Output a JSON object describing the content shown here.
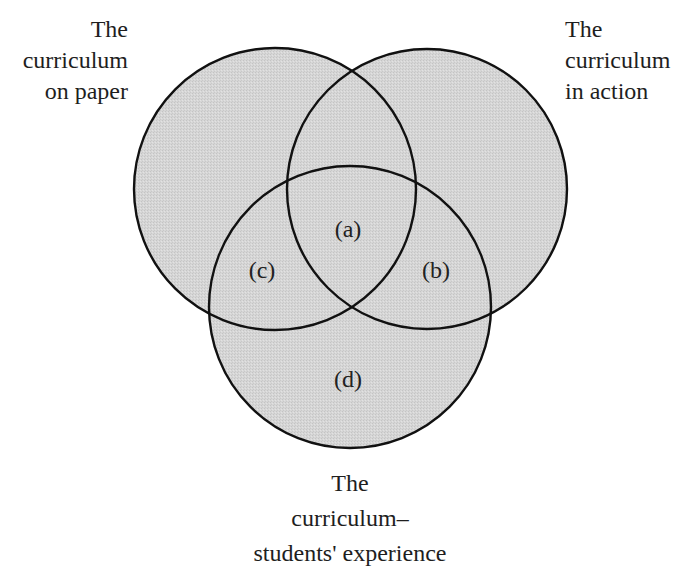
{
  "diagram": {
    "type": "venn",
    "fill_color": "#d4d4d4",
    "stroke_color": "#111111",
    "circles": [
      {
        "id": "paper",
        "cx": 275,
        "cy": 189,
        "r": 141,
        "caption": [
          "The",
          "curriculum",
          "on paper"
        ]
      },
      {
        "id": "action",
        "cx": 427,
        "cy": 189,
        "r": 140,
        "caption": [
          "The",
          "curriculum",
          "in action"
        ]
      },
      {
        "id": "experience",
        "cx": 350,
        "cy": 307,
        "r": 141,
        "caption": [
          "The",
          "curriculum–",
          "students' experience"
        ]
      }
    ],
    "regions": [
      {
        "label": "(a)",
        "x": 348,
        "y": 229
      },
      {
        "label": "(b)",
        "x": 436,
        "y": 270
      },
      {
        "label": "(c)",
        "x": 262,
        "y": 270
      },
      {
        "label": "(d)",
        "x": 348,
        "y": 379
      }
    ]
  }
}
